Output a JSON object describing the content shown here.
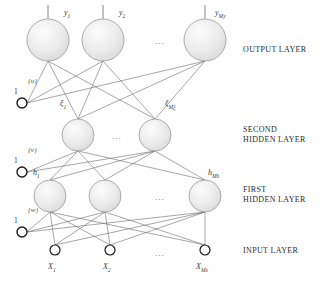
{
  "diagram": {
    "background_color": "#ffffff",
    "node_fill": "#e8e8e8",
    "node_stroke": "#9a9a9a",
    "edge_color": "#6b6b6b",
    "bias_stroke": "#1a1a1a",
    "ellipsis": "...",
    "layers": [
      {
        "id": "output-layer",
        "caption": "OUTPUT LAYER",
        "caption_x": 243,
        "caption_y": 45,
        "node_y": 40,
        "node_r": 21,
        "nodes": [
          {
            "name": "y1",
            "label_main": "y",
            "label_sub": "1",
            "cx": 48,
            "label_x": 64,
            "label_y": 8
          },
          {
            "name": "y2",
            "label_main": "y",
            "label_sub": "2",
            "cx": 103,
            "label_x": 119,
            "label_y": 8
          },
          {
            "name": "yMy",
            "label_main": "y",
            "label_sub": "My",
            "cx": 205,
            "label_x": 215,
            "label_y": 8
          }
        ],
        "ellipsis_x": 155,
        "ellipsis_y": 36,
        "bias": {
          "label": "1",
          "weight_label": "{u}",
          "cx": 22,
          "cy": 103,
          "r": 5
        }
      },
      {
        "id": "second-hidden-layer",
        "caption": "SECOND\nHIDDEN LAYER",
        "caption_x": 243,
        "caption_y": 125,
        "node_y": 135,
        "node_r": 16,
        "nodes": [
          {
            "name": "xi1",
            "label_main": "ξ",
            "label_sub": "1",
            "cx": 78,
            "label_x": 60,
            "label_y": 99
          },
          {
            "name": "xiMxi",
            "label_main": "ξ",
            "label_sub": "Mξ",
            "cx": 155,
            "label_x": 165,
            "label_y": 99
          }
        ],
        "ellipsis_x": 112,
        "ellipsis_y": 131,
        "bias": {
          "label": "1",
          "weight_label": "{v}",
          "cx": 22,
          "cy": 172,
          "r": 5
        }
      },
      {
        "id": "first-hidden-layer",
        "caption": "FIRST\nHIDDEN LAYER",
        "caption_x": 243,
        "caption_y": 185,
        "node_y": 196,
        "node_r": 16,
        "nodes": [
          {
            "name": "h1",
            "label_main": "h",
            "label_sub": "1",
            "cx": 50,
            "label_x": 33,
            "label_y": 168
          },
          {
            "name": "hmid",
            "label_main": "",
            "label_sub": "",
            "cx": 105,
            "label_x": 0,
            "label_y": 0
          },
          {
            "name": "hMh",
            "label_main": "h",
            "label_sub": "Mh",
            "cx": 205,
            "label_x": 208,
            "label_y": 168
          }
        ],
        "ellipsis_x": 155,
        "ellipsis_y": 192,
        "bias": {
          "label": "1",
          "weight_label": "{w}",
          "cx": 22,
          "cy": 232,
          "r": 5
        }
      },
      {
        "id": "input-layer",
        "caption": "INPUT LAYER",
        "caption_x": 243,
        "caption_y": 246,
        "node_y": 250,
        "node_r": 5,
        "nodes": [
          {
            "name": "x1",
            "label_main": "X",
            "label_sub": "1",
            "cx": 55,
            "label_x": 48,
            "label_y": 262
          },
          {
            "name": "x2",
            "label_main": "X",
            "label_sub": "2",
            "cx": 110,
            "label_x": 103,
            "label_y": 262
          },
          {
            "name": "xMx",
            "label_main": "X",
            "label_sub": "Mx",
            "cx": 205,
            "label_x": 196,
            "label_y": 262
          }
        ],
        "ellipsis_x": 155,
        "ellipsis_y": 248,
        "bias": null
      }
    ]
  }
}
